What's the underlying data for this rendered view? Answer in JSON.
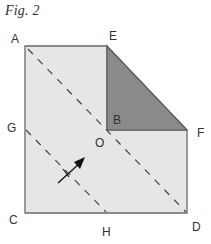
{
  "figure": {
    "title": "Fig. 2"
  },
  "labels": {
    "A": "A",
    "E": "E",
    "B": "B",
    "O": "O",
    "G": "G",
    "F": "F",
    "C": "C",
    "H": "H",
    "D": "D"
  },
  "colors": {
    "paper_fill": "#e6e6e6",
    "folded_flap_fill": "#8a8a8a",
    "edge_stroke": "#6a6a6a",
    "dashed_line": "#444444",
    "arrow": "#111111",
    "label_text": "#333333"
  },
  "shapes": {
    "square_outline": "A-E-F-D-C (paper with top-right corner folded)",
    "folded_flap": "triangle E-B-F",
    "fold_line_1": "A to D (diagonal, through O)",
    "fold_line_2": "G to H (dashed)",
    "arrow": "fold direction arrow pointing toward O"
  }
}
